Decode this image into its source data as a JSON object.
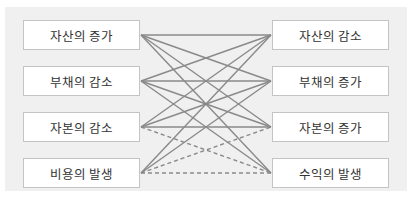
{
  "diagram": {
    "left_items": [
      {
        "label": "자산의 증가"
      },
      {
        "label": "부채의 감소"
      },
      {
        "label": "자본의 감소"
      },
      {
        "label": "비용의 발생"
      }
    ],
    "right_items": [
      {
        "label": "자산의 감소"
      },
      {
        "label": "부채의 증가"
      },
      {
        "label": "자본의 증가"
      },
      {
        "label": "수익의 발생"
      }
    ],
    "connections": [
      {
        "from": 0,
        "to": 0,
        "style": "solid"
      },
      {
        "from": 0,
        "to": 1,
        "style": "solid"
      },
      {
        "from": 0,
        "to": 2,
        "style": "solid"
      },
      {
        "from": 0,
        "to": 3,
        "style": "solid"
      },
      {
        "from": 1,
        "to": 0,
        "style": "solid"
      },
      {
        "from": 1,
        "to": 1,
        "style": "solid"
      },
      {
        "from": 1,
        "to": 2,
        "style": "solid"
      },
      {
        "from": 1,
        "to": 3,
        "style": "solid"
      },
      {
        "from": 2,
        "to": 0,
        "style": "solid"
      },
      {
        "from": 2,
        "to": 1,
        "style": "solid"
      },
      {
        "from": 2,
        "to": 2,
        "style": "solid"
      },
      {
        "from": 2,
        "to": 3,
        "style": "dashed"
      },
      {
        "from": 3,
        "to": 0,
        "style": "solid"
      },
      {
        "from": 3,
        "to": 1,
        "style": "solid"
      },
      {
        "from": 3,
        "to": 2,
        "style": "dashed"
      },
      {
        "from": 3,
        "to": 3,
        "style": "dashed"
      }
    ],
    "colors": {
      "panel": "#f0f0f0",
      "box": "#ffffff",
      "box_border": "#c4c4c4",
      "line": "#8a8a8a",
      "text": "#333333"
    }
  }
}
